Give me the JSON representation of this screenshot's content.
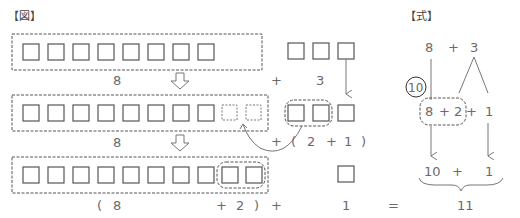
{
  "headers": {
    "figure": "【図】",
    "formula": "【式】"
  },
  "figure": {
    "row1": {
      "left_count": 8,
      "left_label": "8",
      "plus": "+",
      "right_count": 3,
      "right_label": "3"
    },
    "row2": {
      "left_count": 8,
      "empty_slots": 2,
      "left_label": "8",
      "expr": [
        "+",
        "(",
        "2",
        "+",
        "1",
        ")"
      ]
    },
    "row3": {
      "left_count": 10,
      "grouped": 2,
      "right_count": 1
    },
    "bottom_expr": {
      "open_paren": "(",
      "eight": "8",
      "plus_two": "+",
      "two": "2",
      "close_paren": ")",
      "plus": "+",
      "one": "1",
      "equals": "=",
      "result": "11"
    }
  },
  "formula": {
    "top": {
      "a": "8",
      "op": "+",
      "b": "3"
    },
    "circle_label": "10",
    "middle": {
      "a": "8",
      "op1": "+",
      "b": "2",
      "op2": "+",
      "c": "1"
    },
    "lower": {
      "a": "10",
      "op": "+",
      "b": "1"
    }
  },
  "colors": {
    "stroke": "#555555",
    "text": "#6a6a6a",
    "background": "#ffffff"
  }
}
